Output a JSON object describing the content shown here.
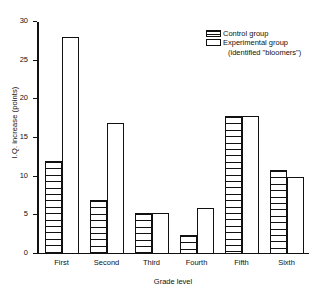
{
  "chart_data": {
    "type": "bar",
    "title": "",
    "xlabel": "Grade level",
    "ylabel": "I.Q. increase (points)",
    "categories": [
      "First",
      "Second",
      "Third",
      "Fourth",
      "Fifth",
      "Sixth"
    ],
    "series": [
      {
        "name": "Control group",
        "fill": "horizontal-hatch",
        "values": [
          12.0,
          7.0,
          5.3,
          2.5,
          17.8,
          10.8
        ]
      },
      {
        "name": "Experimental group (identified \"bloomers\")",
        "fill": "white",
        "values": [
          28.0,
          17.0,
          5.3,
          6.0,
          17.8,
          10.0
        ]
      }
    ],
    "ylim": [
      0,
      30
    ],
    "yticks": [
      0,
      5,
      10,
      15,
      20,
      25,
      30
    ],
    "ytick_labels": [
      "0",
      "5",
      "10",
      "15",
      "20",
      "25",
      "30"
    ],
    "grid": false,
    "legend_position": "top-right"
  },
  "legend": {
    "control_label": "Control group",
    "experimental_label": "Experimental group",
    "experimental_sub": "(identified \"bloomers\")"
  },
  "colors": {
    "axis": "#111111",
    "bar_outline": "#111111",
    "background": "#ffffff"
  }
}
